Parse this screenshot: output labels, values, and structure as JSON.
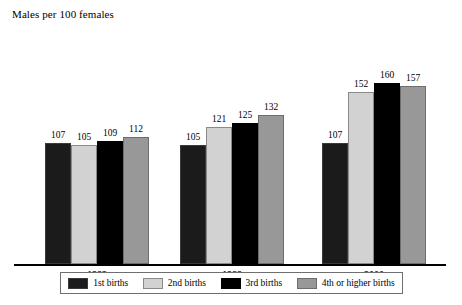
{
  "chart_data": {
    "type": "bar",
    "title": "Males per 100 females",
    "xlabel": "",
    "ylabel": "",
    "ylim": [
      0,
      175
    ],
    "grid": false,
    "legend_position": "bottom",
    "categories": [
      "1982",
      "1989",
      "2000"
    ],
    "series": [
      {
        "name": "1st births",
        "color": "#1b1b1b",
        "values": [
          107,
          105,
          107
        ]
      },
      {
        "name": "2nd births",
        "color": "#d2d2d2",
        "values": [
          105,
          121,
          152
        ]
      },
      {
        "name": "3rd births",
        "color": "#000000",
        "values": [
          109,
          125,
          160
        ]
      },
      {
        "name": "4th or higher births",
        "color": "#989898",
        "values": [
          112,
          132,
          157
        ]
      }
    ]
  }
}
